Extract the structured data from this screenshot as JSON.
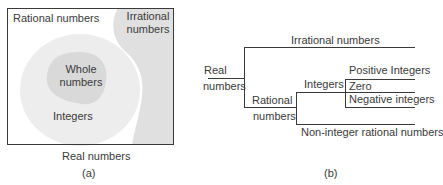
{
  "panel_a": {
    "caption": "(a)",
    "outer_label": "Real numbers",
    "rational_label": "Rational numbers",
    "irrational_label_1": "Irrational",
    "irrational_label_2": "numbers",
    "integers_label": "Integers",
    "whole_label_1": "Whole",
    "whole_label_2": "numbers",
    "colors": {
      "border": "#3a3a3a",
      "irrational_fill": "#e0e0e0",
      "integers_fill": "#ededed",
      "whole_fill": "#d9d9d9"
    }
  },
  "panel_b": {
    "caption": "(b)",
    "root_label_1": "Real",
    "root_label_2": "numbers",
    "irrational": "Irrational numbers",
    "rational_label_1": "Rational",
    "rational_label_2": "numbers",
    "integers": "Integers",
    "positive": "Positive Integers",
    "zero": "Zero",
    "negative": "Negative integers",
    "non_integer": "Non-integer rational numbers"
  }
}
